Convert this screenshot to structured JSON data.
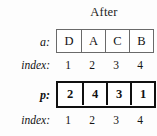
{
  "figure": {
    "title": "After",
    "rows": [
      {
        "label": "a:",
        "style": "thin",
        "cells": [
          "D",
          "A",
          "C",
          "B"
        ],
        "index_label": "index:",
        "index_values": [
          "1",
          "2",
          "3",
          "4"
        ]
      },
      {
        "label": "p:",
        "style": "thick",
        "cells": [
          "2",
          "4",
          "3",
          "1"
        ],
        "index_label": "index:",
        "index_values": [
          "1",
          "2",
          "3",
          "4"
        ]
      }
    ]
  },
  "colors": {
    "background": "#fdfdfd",
    "thin_border": "#6a6a6a",
    "thick_border": "#101010",
    "text": "#121212"
  }
}
